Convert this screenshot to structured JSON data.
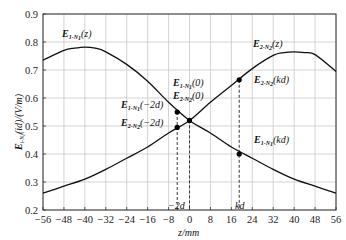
{
  "chart_data": {
    "type": "line",
    "title": "",
    "xlabel": "z/mm",
    "ylabel": "E_{i-N_i}(id)/(V/m)",
    "xlim": [
      -56,
      56
    ],
    "ylim": [
      0.2,
      0.9
    ],
    "grid": true,
    "xticks": [
      -56,
      -48,
      -40,
      -32,
      -24,
      -16,
      -8,
      0,
      8,
      16,
      24,
      32,
      40,
      48,
      56
    ],
    "xtick_labels": [
      "−56",
      "−48",
      "−40",
      "−32",
      "−24",
      "−16",
      "−8",
      "0",
      "8",
      "16",
      "24",
      "32",
      "40",
      "48",
      "56"
    ],
    "yticks": [
      0.2,
      0.3,
      0.4,
      0.5,
      0.6,
      0.7,
      0.8,
      0.9
    ],
    "ytick_labels": [
      "0.2",
      "0.3",
      "0.4",
      "0.5",
      "0.6",
      "0.7",
      "0.8",
      "0.9"
    ],
    "series": [
      {
        "name": "E_{1-N_1}(z)",
        "x": [
          -56,
          -48,
          -44,
          -40,
          -36,
          -32,
          -24,
          -16,
          -8,
          0,
          8,
          16,
          24,
          32,
          40,
          48,
          56
        ],
        "values": [
          0.735,
          0.77,
          0.778,
          0.782,
          0.778,
          0.765,
          0.72,
          0.66,
          0.585,
          0.52,
          0.475,
          0.425,
          0.385,
          0.345,
          0.31,
          0.285,
          0.26
        ]
      },
      {
        "name": "E_{2-N_2}(z)",
        "x": [
          -56,
          -48,
          -40,
          -32,
          -24,
          -16,
          -8,
          0,
          8,
          16,
          24,
          32,
          36,
          40,
          44,
          48,
          56
        ],
        "values": [
          0.26,
          0.285,
          0.31,
          0.345,
          0.385,
          0.425,
          0.475,
          0.52,
          0.585,
          0.645,
          0.705,
          0.752,
          0.762,
          0.765,
          0.762,
          0.755,
          0.695
        ]
      }
    ],
    "markers": [
      {
        "label": "E_{1-N_1}(−2d)",
        "x": -4.7,
        "y": 0.55
      },
      {
        "label": "E_{2-N_2}(−2d)",
        "x": -4.7,
        "y": 0.495
      },
      {
        "label": "E_{1-N_1}(0) / E_{2-N_2}(0)",
        "x": 0,
        "y": 0.52
      },
      {
        "label": "E_{2-N_2}(kd)",
        "x": 19,
        "y": 0.665
      },
      {
        "label": "E_{1-N_1}(kd)",
        "x": 19,
        "y": 0.4
      }
    ],
    "vlines": [
      {
        "label": "−2d",
        "x": -4.7
      },
      {
        "label": "0",
        "x": 0
      },
      {
        "label": "kd",
        "x": 19
      }
    ],
    "annotations": [
      {
        "text": "E_{1-N_1}(z)",
        "x": -44,
        "y": 0.82
      },
      {
        "text": "E_{2-N_2}(z)",
        "x": 28,
        "y": 0.78
      },
      {
        "text": "E_{1-N_1}(0)",
        "x": -2,
        "y": 0.6
      },
      {
        "text": "E_{2-N_2}(0)",
        "x": -2,
        "y": 0.56
      },
      {
        "text": "E_{1-N_1}(−2d)",
        "x": -22,
        "y": 0.55
      },
      {
        "text": "E_{2-N_2}(−2d)",
        "x": -22,
        "y": 0.49
      },
      {
        "text": "E_{2-N_2}(kd)",
        "x": 22,
        "y": 0.64
      },
      {
        "text": "E_{1-N_1}(kd)",
        "x": 22,
        "y": 0.42
      }
    ]
  },
  "labels": {
    "xlabel": "z/mm",
    "ylabel_main": "E",
    "ylabel_sub": "i-N",
    "ylabel_subsub": "i",
    "ylabel_rest": "(id)/(V/m)",
    "vline_neg2d": "−2d",
    "vline_kd": "kd",
    "curve1": {
      "main": "E",
      "sub": "1-N",
      "subsub": "1",
      "arg": "(z)"
    },
    "curve2": {
      "main": "E",
      "sub": "2-N",
      "subsub": "2",
      "arg": "(z)"
    },
    "e1_0": {
      "main": "E",
      "sub": "1-N",
      "subsub": "1",
      "arg": "(0)"
    },
    "e2_0": {
      "main": "E",
      "sub": "2-N",
      "subsub": "2",
      "arg": "(0)"
    },
    "e1_m2d": {
      "main": "E",
      "sub": "1-N",
      "subsub": "1",
      "arg": "(−2d)"
    },
    "e2_m2d": {
      "main": "E",
      "sub": "2-N",
      "subsub": "2",
      "arg": "(−2d)"
    },
    "e2_kd": {
      "main": "E",
      "sub": "2-N",
      "subsub": "2",
      "arg": "(kd)"
    },
    "e1_kd": {
      "main": "E",
      "sub": "1-N",
      "subsub": "1",
      "arg": "(kd)"
    }
  }
}
